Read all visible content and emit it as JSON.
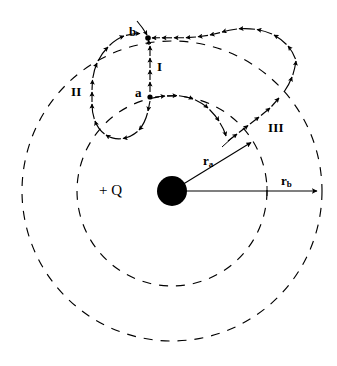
{
  "figure": {
    "type": "physics-diagram",
    "width": 337,
    "height": 366,
    "background_color": "#ffffff",
    "stroke_color": "#000000"
  },
  "charge": {
    "label": "+ Q",
    "sign": "positive",
    "center": {
      "x": 172,
      "y": 191
    },
    "radius": 15,
    "fill_color": "#000000",
    "label_position": {
      "x": 106,
      "y": 184
    }
  },
  "equipotentials": [
    {
      "name": "inner-equipotential",
      "radius": 95,
      "style": "dashed",
      "stroke_color": "#000000",
      "radius_label": "r_a"
    },
    {
      "name": "outer-equipotential",
      "radius": 150,
      "style": "dashed",
      "stroke_color": "#000000",
      "radius_label": "r_b"
    }
  ],
  "radii": [
    {
      "name": "r-a",
      "label": "r",
      "subscript": "a",
      "label_position": {
        "x": 205,
        "y": 156
      },
      "from": {
        "x": 172,
        "y": 191
      },
      "to": {
        "x": 253,
        "y": 141
      }
    },
    {
      "name": "r-b",
      "label": "r",
      "subscript": "b",
      "label_position": {
        "x": 283,
        "y": 176
      },
      "from": {
        "x": 172,
        "y": 191
      },
      "to": {
        "x": 320,
        "y": 191
      }
    }
  ],
  "points": [
    {
      "id": "a",
      "label": "a",
      "position": {
        "x": 150,
        "y": 97
      },
      "label_position": {
        "x": 137,
        "y": 87
      },
      "on_circle": "inner-equipotential"
    },
    {
      "id": "b",
      "label": "b",
      "position": {
        "x": 148,
        "y": 38
      },
      "label_position": {
        "x": 131,
        "y": 26
      },
      "on_circle": "outer-equipotential"
    }
  ],
  "paths": [
    {
      "id": "I",
      "label": "I",
      "label_position": {
        "x": 158,
        "y": 61
      },
      "description": "straight radial dashed arrow from a to b",
      "style": "dashed-with-arrowheads",
      "direction": "a-to-b"
    },
    {
      "id": "II",
      "label": "II",
      "label_position": {
        "x": 74,
        "y": 86
      },
      "description": "closed loop excursion from a going down, around to the left, up and over to b",
      "style": "dashed-with-arrowheads",
      "direction": "a-to-b"
    },
    {
      "id": "III",
      "label": "III",
      "label_position": {
        "x": 272,
        "y": 122
      },
      "description": "from a along inner circle to the right, radially outward to outer circle, then back along outer circle to b",
      "style": "dashed-with-arrowheads",
      "direction": "a-to-b"
    }
  ]
}
